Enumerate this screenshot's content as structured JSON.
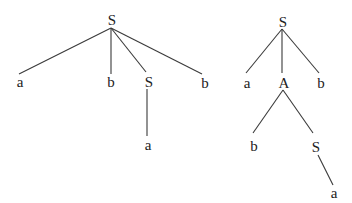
{
  "diagram": {
    "title": "",
    "type": "parse-trees",
    "line_color": "#3a3a3a",
    "text_color": "#222222",
    "trees": [
      {
        "id": "left-tree",
        "nodes": [
          {
            "id": "L-S",
            "label": "S",
            "x": 112,
            "y": 20
          },
          {
            "id": "L-a",
            "label": "a",
            "x": 20,
            "y": 82
          },
          {
            "id": "L-b1",
            "label": "b",
            "x": 111,
            "y": 82
          },
          {
            "id": "L-S2",
            "label": "S",
            "x": 149,
            "y": 82
          },
          {
            "id": "L-b2",
            "label": "b",
            "x": 205,
            "y": 83
          },
          {
            "id": "L-a2",
            "label": "a",
            "x": 148,
            "y": 145
          }
        ],
        "edges": [
          {
            "from": "L-S",
            "to": "L-a",
            "x1": 111,
            "y1": 28,
            "x2": 19,
            "y2": 74
          },
          {
            "from": "L-S",
            "to": "L-b1",
            "x1": 111,
            "y1": 28,
            "x2": 111,
            "y2": 74
          },
          {
            "from": "L-S",
            "to": "L-S2",
            "x1": 111,
            "y1": 28,
            "x2": 146,
            "y2": 72
          },
          {
            "from": "L-S",
            "to": "L-b2",
            "x1": 111,
            "y1": 28,
            "x2": 202,
            "y2": 74
          },
          {
            "from": "L-S2",
            "to": "L-a2",
            "x1": 147,
            "y1": 89,
            "x2": 147,
            "y2": 136
          }
        ]
      },
      {
        "id": "right-tree",
        "nodes": [
          {
            "id": "R-S",
            "label": "S",
            "x": 283,
            "y": 22
          },
          {
            "id": "R-a",
            "label": "a",
            "x": 247,
            "y": 83
          },
          {
            "id": "R-A",
            "label": "A",
            "x": 284,
            "y": 83
          },
          {
            "id": "R-b",
            "label": "b",
            "x": 321,
            "y": 83
          },
          {
            "id": "R-b2",
            "label": "b",
            "x": 254,
            "y": 146
          },
          {
            "id": "R-S2",
            "label": "S",
            "x": 316,
            "y": 147
          },
          {
            "id": "R-a2",
            "label": "a",
            "x": 334,
            "y": 193
          }
        ],
        "edges": [
          {
            "from": "R-S",
            "to": "R-a",
            "x1": 282,
            "y1": 29,
            "x2": 246,
            "y2": 73
          },
          {
            "from": "R-S",
            "to": "R-A",
            "x1": 282,
            "y1": 29,
            "x2": 282,
            "y2": 73
          },
          {
            "from": "R-S",
            "to": "R-b",
            "x1": 282,
            "y1": 29,
            "x2": 319,
            "y2": 73
          },
          {
            "from": "R-A",
            "to": "R-b2",
            "x1": 283,
            "y1": 90,
            "x2": 253,
            "y2": 133
          },
          {
            "from": "R-A",
            "to": "R-S2",
            "x1": 283,
            "y1": 90,
            "x2": 313,
            "y2": 133
          },
          {
            "from": "R-S2",
            "to": "R-a2",
            "x1": 318,
            "y1": 155,
            "x2": 333,
            "y2": 185
          }
        ]
      }
    ]
  }
}
